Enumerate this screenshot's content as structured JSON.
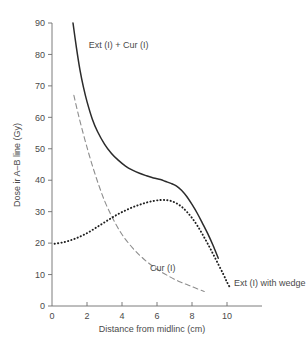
{
  "chart_data": {
    "type": "line",
    "title": "",
    "xlabel": "Distance from midlinc (cm)",
    "ylabel": "Dose ir A–B line (Gy)",
    "xlim": [
      0,
      12
    ],
    "ylim": [
      0,
      90
    ],
    "xticks": [
      0,
      2,
      4,
      6,
      8,
      10
    ],
    "xtick_labels": [
      "0",
      "2",
      "4",
      "6",
      "8",
      "10"
    ],
    "yticks": [
      0,
      10,
      20,
      30,
      40,
      50,
      60,
      70,
      80,
      90
    ],
    "ytick_labels": [
      "0",
      "10",
      "20",
      "30",
      "40",
      "50",
      "60",
      "70",
      "80",
      "90"
    ],
    "grid": false,
    "legend_position": "inline-annotations",
    "series": [
      {
        "name": "Ext (I) + Cur (I)",
        "style": "solid",
        "color": "#2b2b2b",
        "label_x": 2.1,
        "label_y": 82,
        "points": [
          [
            1.2,
            90.0
          ],
          [
            1.4,
            82.0
          ],
          [
            1.6,
            75.0
          ],
          [
            1.8,
            69.5
          ],
          [
            2.0,
            65.0
          ],
          [
            2.3,
            59.5
          ],
          [
            2.6,
            55.5
          ],
          [
            3.0,
            51.5
          ],
          [
            3.4,
            48.5
          ],
          [
            3.8,
            46.3
          ],
          [
            4.2,
            44.5
          ],
          [
            4.6,
            43.2
          ],
          [
            5.0,
            42.2
          ],
          [
            5.4,
            41.4
          ],
          [
            5.8,
            40.7
          ],
          [
            6.2,
            40.2
          ],
          [
            6.5,
            39.6
          ],
          [
            6.8,
            39.0
          ],
          [
            7.1,
            38.2
          ],
          [
            7.4,
            36.8
          ],
          [
            7.7,
            34.8
          ],
          [
            8.0,
            32.3
          ],
          [
            8.3,
            29.5
          ],
          [
            8.6,
            26.3
          ],
          [
            8.9,
            23.0
          ],
          [
            9.2,
            19.3
          ],
          [
            9.5,
            15.2
          ]
        ]
      },
      {
        "name": "Cur (I)",
        "style": "dashed",
        "color": "#8d8d8d",
        "label_x": 5.6,
        "label_y": 11,
        "points": [
          [
            1.25,
            67.0
          ],
          [
            1.5,
            61.0
          ],
          [
            1.8,
            54.5
          ],
          [
            2.1,
            48.5
          ],
          [
            2.4,
            43.0
          ],
          [
            2.7,
            38.0
          ],
          [
            3.0,
            33.5
          ],
          [
            3.3,
            29.8
          ],
          [
            3.6,
            26.5
          ],
          [
            3.9,
            23.6
          ],
          [
            4.2,
            21.2
          ],
          [
            4.6,
            18.5
          ],
          [
            5.0,
            16.2
          ],
          [
            5.4,
            14.2
          ],
          [
            5.8,
            12.5
          ],
          [
            6.2,
            11.0
          ],
          [
            6.6,
            9.7
          ],
          [
            7.0,
            8.5
          ],
          [
            7.4,
            7.5
          ],
          [
            7.8,
            6.6
          ],
          [
            8.2,
            5.7
          ],
          [
            8.7,
            4.6
          ]
        ]
      },
      {
        "name": "Ext (I) with wedge",
        "style": "dotted",
        "color": "#1f1f1f",
        "label_x": 10.4,
        "label_y": 6.5,
        "points": [
          [
            0.15,
            19.8
          ],
          [
            0.6,
            20.2
          ],
          [
            1.0,
            20.8
          ],
          [
            1.4,
            21.6
          ],
          [
            1.8,
            22.6
          ],
          [
            2.2,
            23.8
          ],
          [
            2.6,
            25.2
          ],
          [
            3.0,
            26.6
          ],
          [
            3.4,
            28.0
          ],
          [
            3.8,
            29.3
          ],
          [
            4.2,
            30.4
          ],
          [
            4.6,
            31.4
          ],
          [
            5.0,
            32.2
          ],
          [
            5.4,
            32.9
          ],
          [
            5.8,
            33.4
          ],
          [
            6.2,
            33.7
          ],
          [
            6.5,
            33.7
          ],
          [
            6.8,
            33.4
          ],
          [
            7.1,
            32.7
          ],
          [
            7.4,
            31.6
          ],
          [
            7.7,
            30.0
          ],
          [
            8.0,
            28.0
          ],
          [
            8.3,
            25.6
          ],
          [
            8.6,
            22.8
          ],
          [
            8.9,
            19.8
          ],
          [
            9.2,
            16.6
          ],
          [
            9.5,
            13.3
          ],
          [
            9.8,
            10.0
          ],
          [
            10.0,
            7.6
          ],
          [
            10.2,
            5.6
          ]
        ]
      }
    ]
  }
}
